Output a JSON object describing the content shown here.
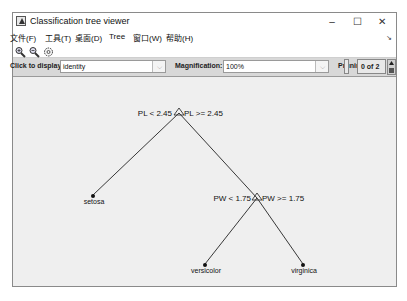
{
  "window": {
    "title": "Classification tree viewer",
    "controls": {
      "minimize": "–",
      "maximize": "☐",
      "close": "✕"
    }
  },
  "menubar": {
    "items": [
      {
        "label": "文件(F)"
      },
      {
        "label": "工具(T)"
      },
      {
        "label": "桌面(D)"
      },
      {
        "label": "Tree"
      },
      {
        "label": "窗口(W)"
      },
      {
        "label": "帮助(H)"
      }
    ],
    "overflow_arrow": "↘"
  },
  "toolbar": {
    "icons": [
      "zoom-in-icon",
      "zoom-out-icon",
      "pan-hand-icon"
    ]
  },
  "controls": {
    "click_to_display_label": "Click to display:",
    "click_to_display_value": "identity",
    "magnification_label": "Magnification:",
    "magnification_value": "100%",
    "pruning_label": "Pruning level:",
    "pruning_value": "0 of 2",
    "dropdown_arrow": "⌵"
  },
  "tree": {
    "nodes": [
      {
        "id": "root",
        "type": "branch",
        "left_rule": "PL < 2.45",
        "right_rule": "PL >= 2.45"
      },
      {
        "id": "leaf1",
        "type": "leaf",
        "label": "setosa"
      },
      {
        "id": "node2",
        "type": "branch",
        "left_rule": "PW < 1.75",
        "right_rule": "PW >= 1.75"
      },
      {
        "id": "leaf2",
        "type": "leaf",
        "label": "versicolor"
      },
      {
        "id": "leaf3",
        "type": "leaf",
        "label": "virginica"
      }
    ]
  }
}
